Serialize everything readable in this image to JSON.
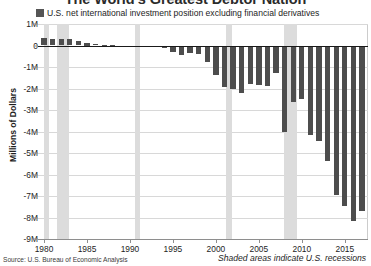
{
  "chart_data": {
    "type": "bar",
    "title": "The World's Greatest Debtor Nation",
    "xlabel": "",
    "ylabel": "Millions of Dollars",
    "ylim": [
      -9000000,
      1000000
    ],
    "xlim": [
      1979.3,
      2017.7
    ],
    "grid": true,
    "legend_position": "top-left",
    "legend": [
      "U.S. net international investment position excluding financial derivatives"
    ],
    "ytick_labels": [
      "1M",
      "0",
      "-1M",
      "-2M",
      "-3M",
      "-4M",
      "-5M",
      "-6M",
      "-7M",
      "-8M",
      "-9M"
    ],
    "ytick_values": [
      1000000,
      0,
      -1000000,
      -2000000,
      -3000000,
      -4000000,
      -5000000,
      -6000000,
      -7000000,
      -8000000,
      -9000000
    ],
    "xtick_labels": [
      "1980",
      "1985",
      "1990",
      "1995",
      "2000",
      "2005",
      "2010",
      "2015"
    ],
    "xtick_values": [
      1980,
      1985,
      1990,
      1995,
      2000,
      2005,
      2010,
      2015
    ],
    "series": [
      {
        "name": "U.S. net international investment position excluding financial derivatives",
        "color": "#4d4d4d",
        "x": [
          1980,
          1981,
          1982,
          1983,
          1984,
          1985,
          1986,
          1987,
          1988,
          1989,
          1990,
          1991,
          1992,
          1993,
          1994,
          1995,
          1996,
          1997,
          1998,
          1999,
          2000,
          2001,
          2002,
          2003,
          2004,
          2005,
          2006,
          2007,
          2008,
          2009,
          2010,
          2011,
          2012,
          2013,
          2014,
          2015,
          2016,
          2017
        ],
        "values": [
          360000,
          325000,
          290000,
          300000,
          195000,
          125000,
          60000,
          45000,
          30000,
          -50000,
          -80000,
          -60000,
          -50000,
          -90000,
          -120000,
          -305000,
          -440000,
          -360000,
          -400000,
          -775000,
          -1390000,
          -1920000,
          -2040000,
          -2190000,
          -1770000,
          -1860000,
          -1880000,
          -1290000,
          -4010000,
          -2630000,
          -2510000,
          -4160000,
          -4450000,
          -5360000,
          -6940000,
          -7460000,
          -8180000,
          -7720000
        ]
      }
    ],
    "recessions": [
      {
        "start": 1980.0,
        "end": 1980.55
      },
      {
        "start": 1981.5,
        "end": 1982.9
      },
      {
        "start": 1990.55,
        "end": 1991.2
      },
      {
        "start": 2001.2,
        "end": 2001.9
      },
      {
        "start": 2007.95,
        "end": 2009.45
      }
    ]
  },
  "footer": {
    "source": "Source: U.S. Bureau of Economic Analysis",
    "recession_note": "Shaded areas indicate U.S. recessions"
  }
}
